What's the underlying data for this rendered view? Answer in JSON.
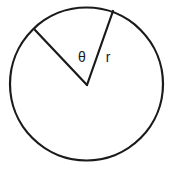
{
  "figure": {
    "name": "circle-sector-diagram",
    "background_color": "#ffffff",
    "stroke_color": "#1a1a1a",
    "text_color": "#1a1a1a"
  },
  "circle": {
    "center_x": 86.5,
    "center_y": 84,
    "radius": 76.5,
    "stroke_width": 2.2
  },
  "sector": {
    "vertex_x": 87,
    "vertex_y": 85,
    "radius_a": {
      "name": "left-radius",
      "end_x": 35,
      "end_y": 30,
      "stroke_width": 2.2
    },
    "radius_b": {
      "name": "right-radius",
      "end_x": 113,
      "end_y": 11,
      "stroke_width": 2.2
    }
  },
  "labels": {
    "angle": {
      "text": "θ",
      "x": 82,
      "y": 58,
      "font_size": 14
    },
    "radius": {
      "text": "r",
      "x": 108,
      "y": 58,
      "font_size": 14
    }
  }
}
